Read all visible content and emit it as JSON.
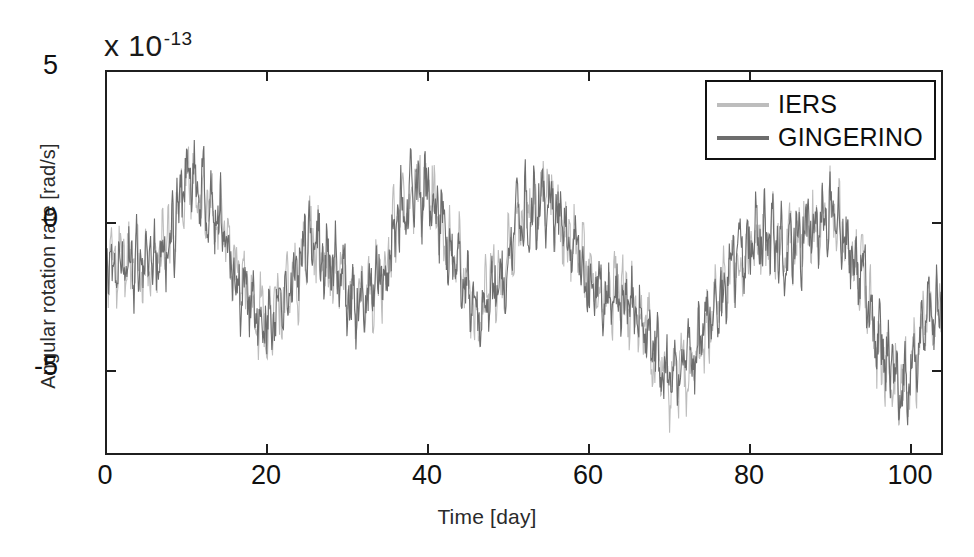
{
  "chart_data": {
    "type": "line",
    "title": "",
    "xlabel": "Time [day]",
    "ylabel": "Angular rotation rate [rad/s]",
    "y_exponent_mantissa": "x 10",
    "y_exponent_power": "-13",
    "y_scale_factor": 1e-13,
    "xlim": [
      -1.5,
      103.5
    ],
    "ylim": [
      -7.7,
      5.0
    ],
    "xticks": [
      0,
      20,
      40,
      60,
      80,
      100
    ],
    "xticklabels": [
      "0",
      "20",
      "40",
      "60",
      "80",
      "100"
    ],
    "yticks": [
      5,
      0,
      -5
    ],
    "yticklabels": [
      "5",
      "0",
      "-5"
    ],
    "grid": false,
    "legend_position": "top-right",
    "series": [
      {
        "name": "IERS",
        "color": "#bdbdbd",
        "linewidth": 1.1,
        "description": "Light grey trace, nearly coincident with GINGERINO except near days 70-74 and 95-100 where it extends further down",
        "trend_anchors_x": [
          0,
          3,
          6,
          9,
          12,
          15,
          18,
          21,
          24,
          27,
          30,
          33,
          36,
          39,
          42,
          45,
          48,
          51,
          54,
          57,
          60,
          63,
          66,
          69,
          72,
          75,
          78,
          81,
          84,
          87,
          90,
          93,
          96,
          99,
          102
        ],
        "trend_anchors_y": [
          -1.4,
          -1.6,
          -0.6,
          1.5,
          0.4,
          -1.9,
          -3.2,
          -2.6,
          -0.6,
          -1.6,
          -2.9,
          -1.8,
          0.6,
          1.2,
          -1.0,
          -3.0,
          -1.9,
          0.3,
          0.9,
          -0.8,
          -2.2,
          -2.4,
          -3.4,
          -5.3,
          -5.0,
          -3.0,
          -1.2,
          -0.6,
          -0.9,
          -0.3,
          0.4,
          -1.4,
          -4.6,
          -5.6,
          -3.0
        ],
        "noise_amplitude": 1.7
      },
      {
        "name": "GINGERINO",
        "color": "#6d6d6d",
        "linewidth": 1.1,
        "description": "Dark grey trace overlaying the IERS trace for most of the record",
        "trend_anchors_x": [
          0,
          3,
          6,
          9,
          12,
          15,
          18,
          21,
          24,
          27,
          30,
          33,
          36,
          39,
          42,
          45,
          48,
          51,
          54,
          57,
          60,
          63,
          66,
          69,
          72,
          75,
          78,
          81,
          84,
          87,
          90,
          93,
          96,
          99,
          102
        ],
        "trend_anchors_y": [
          -1.4,
          -1.6,
          -0.6,
          1.5,
          0.4,
          -1.9,
          -3.2,
          -2.6,
          -0.6,
          -1.6,
          -2.9,
          -1.8,
          0.6,
          1.2,
          -1.0,
          -3.0,
          -1.9,
          0.3,
          0.9,
          -0.8,
          -2.2,
          -2.4,
          -3.4,
          -5.2,
          -4.4,
          -2.8,
          -1.1,
          -0.6,
          -0.9,
          -0.3,
          0.4,
          -1.4,
          -4.4,
          -5.4,
          -3.0
        ],
        "noise_amplitude": 1.7
      }
    ],
    "annotations": [
      "High frequency day-to-day scatter of roughly +/- 2e-13 superimposed on a slow oscillation with period ~13 days",
      "Envelope minima near days 17, 28, 44, 62, 69-73, 95-100",
      "Envelope maxima near days 9, 23, 36, 49, 58, 78, 89"
    ]
  },
  "legend": {
    "items": [
      {
        "label": "IERS",
        "color": "#bdbdbd"
      },
      {
        "label": "GINGERINO",
        "color": "#6d6d6d"
      }
    ]
  },
  "axes": {
    "x_title": "Time [day]",
    "y_title": "Angular rotation rate [rad/s]",
    "exponent_mantissa": "x 10",
    "exponent_power": "-13",
    "x_tick_labels": [
      "0",
      "20",
      "40",
      "60",
      "80",
      "100"
    ],
    "y_tick_labels": [
      "5",
      "0",
      "-5"
    ]
  },
  "colors": {
    "background": "#ffffff",
    "frame": "#1f1f1f",
    "iers": "#bdbdbd",
    "gingerino": "#6d6d6d",
    "text": "#111111"
  }
}
